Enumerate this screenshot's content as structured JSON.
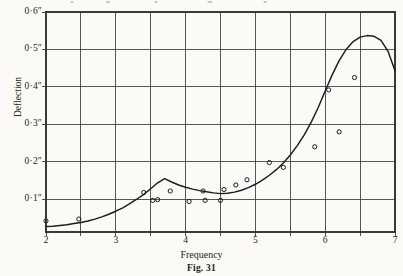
{
  "figure": {
    "caption": "Fig. 31",
    "paper_color": "#fbfaf7",
    "ink_color": "#1c1c1c",
    "grid_color": "#3a3a37"
  },
  "chart_data": {
    "type": "line",
    "title": "",
    "subtitle": "",
    "xlabel": "Frequency",
    "ylabel": "Deflection",
    "xlim": [
      2,
      7
    ],
    "ylim": [
      0.0125,
      0.6
    ],
    "grid": true,
    "legend": "none",
    "x_tick_labels": [
      "2",
      "3",
      "4",
      "5",
      "6",
      "7"
    ],
    "x_tick_values": [
      2,
      3,
      4,
      5,
      6,
      7
    ],
    "x_gridline_values": [
      2,
      2.5,
      3,
      3.5,
      4,
      4.5,
      5,
      5.5,
      6,
      6.5,
      7
    ],
    "y_tick_labels": [
      "0·6″",
      "0·5″",
      "0·4″",
      "0·3″",
      "0·2″",
      "0·1″"
    ],
    "y_tick_values": [
      0.6,
      0.5,
      0.4,
      0.3,
      0.2,
      0.1
    ],
    "y_gridline_values": [
      0.1,
      0.2,
      0.3,
      0.4,
      0.5,
      0.6
    ],
    "series": [
      {
        "name": "fitted resonance curve",
        "kind": "line",
        "x": [
          2.0,
          2.1,
          2.2,
          2.3,
          2.4,
          2.5,
          2.6,
          2.7,
          2.8,
          2.9,
          3.0,
          3.1,
          3.2,
          3.3,
          3.4,
          3.5,
          3.6,
          3.7,
          3.8,
          3.9,
          4.0,
          4.1,
          4.2,
          4.3,
          4.4,
          4.5,
          4.6,
          4.7,
          4.8,
          4.9,
          5.0,
          5.1,
          5.2,
          5.3,
          5.4,
          5.5,
          5.6,
          5.7,
          5.8,
          5.9,
          6.0,
          6.1,
          6.2,
          6.3,
          6.4,
          6.5,
          6.6,
          6.7,
          6.8,
          6.9,
          7.0
        ],
        "y": [
          0.027,
          0.028,
          0.03,
          0.032,
          0.035,
          0.038,
          0.042,
          0.047,
          0.053,
          0.06,
          0.068,
          0.077,
          0.088,
          0.1,
          0.113,
          0.128,
          0.144,
          0.155,
          0.146,
          0.138,
          0.132,
          0.127,
          0.123,
          0.12,
          0.117,
          0.115,
          0.116,
          0.119,
          0.124,
          0.131,
          0.14,
          0.151,
          0.164,
          0.179,
          0.197,
          0.218,
          0.243,
          0.272,
          0.306,
          0.345,
          0.389,
          0.432,
          0.47,
          0.5,
          0.521,
          0.533,
          0.537,
          0.535,
          0.524,
          0.495,
          0.443
        ]
      },
      {
        "name": "measured points",
        "kind": "scatter",
        "marker": "open-circle",
        "x": [
          2.0,
          2.47,
          3.4,
          3.53,
          3.6,
          3.78,
          4.05,
          4.25,
          4.28,
          4.5,
          4.55,
          4.72,
          4.88,
          5.2,
          5.4,
          5.85,
          6.05,
          6.2,
          6.42
        ],
        "y": [
          0.042,
          0.047,
          0.118,
          0.097,
          0.099,
          0.122,
          0.094,
          0.122,
          0.097,
          0.097,
          0.126,
          0.138,
          0.152,
          0.198,
          0.185,
          0.24,
          0.392,
          0.28,
          0.425
        ]
      }
    ]
  }
}
